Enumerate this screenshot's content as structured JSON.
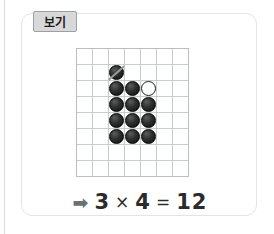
{
  "card": {
    "tab_label": "보기"
  },
  "grid": {
    "columns": 7,
    "rows": 8,
    "cell_size_px": 16,
    "stones": [
      {
        "row": 1,
        "col": 2,
        "type": "black",
        "struck_out": true
      },
      {
        "row": 2,
        "col": 2,
        "type": "black",
        "struck_out": false
      },
      {
        "row": 2,
        "col": 3,
        "type": "black",
        "struck_out": false
      },
      {
        "row": 2,
        "col": 4,
        "type": "white",
        "struck_out": false
      },
      {
        "row": 3,
        "col": 2,
        "type": "black",
        "struck_out": false
      },
      {
        "row": 3,
        "col": 3,
        "type": "black",
        "struck_out": false
      },
      {
        "row": 3,
        "col": 4,
        "type": "black",
        "struck_out": false
      },
      {
        "row": 4,
        "col": 2,
        "type": "black",
        "struck_out": false
      },
      {
        "row": 4,
        "col": 3,
        "type": "black",
        "struck_out": false
      },
      {
        "row": 4,
        "col": 4,
        "type": "black",
        "struck_out": false
      },
      {
        "row": 5,
        "col": 2,
        "type": "black",
        "struck_out": false
      },
      {
        "row": 5,
        "col": 3,
        "type": "black",
        "struck_out": false
      },
      {
        "row": 5,
        "col": 4,
        "type": "black",
        "struck_out": false
      }
    ]
  },
  "equation": {
    "arrow_icon": "➡",
    "left_operand": "3",
    "operator": "×",
    "right_operand": "4",
    "equals": "=",
    "result": "12"
  },
  "colors": {
    "card_border": "#e2e5e8",
    "tab_background": "#d8d8d8",
    "tab_border": "#9aa0a5",
    "grid_line": "#c8ccd1",
    "grid_frame": "#b9bec4",
    "stone_black": "#1d1d1d",
    "stone_white": "#ffffff",
    "equation_text": "#2b2b2b",
    "arrow": "#6d7176"
  }
}
